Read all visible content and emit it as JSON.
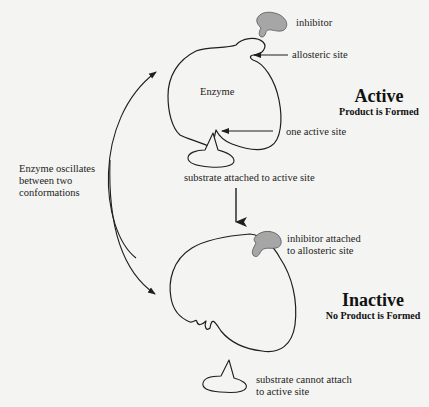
{
  "diagram": {
    "colors": {
      "background": "#f4f4f2",
      "line": "#1f1f1f",
      "inhibitor_fill": "#a6a6a6"
    },
    "active_state": {
      "heading": "Active",
      "subheading": "Product is Formed",
      "enzyme_label": "Enzyme",
      "labels": {
        "inhibitor": "inhibitor",
        "allosteric_site": "allosteric site",
        "active_site": "one active site",
        "substrate": "substrate attached to active site"
      }
    },
    "inactive_state": {
      "heading": "Inactive",
      "subheading": "No Product is Formed",
      "labels": {
        "inhibitor_attached_line1": "inhibitor attached",
        "inhibitor_attached_line2": "to allosteric site",
        "substrate_line1": "substrate cannot attach",
        "substrate_line2": "to active site"
      }
    },
    "oscillation_note": {
      "line1": "Enzyme oscillates",
      "line2": "between two",
      "line3": "conformations"
    }
  }
}
